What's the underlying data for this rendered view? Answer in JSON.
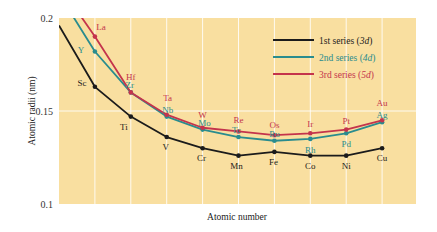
{
  "chart_data": {
    "type": "line",
    "title": "",
    "xlabel": "Atomic number",
    "ylabel": "Atomic radii (nm)",
    "ylim": [
      0.1,
      0.2
    ],
    "yticks": [
      0.1,
      0.15,
      0.2
    ],
    "ytick_labels": [
      "0.1",
      "0.15",
      "0.2"
    ],
    "grid": true,
    "legend_position": "top-right",
    "background_color": "#f9dfa0",
    "positions": 10,
    "series": [
      {
        "name": "1st series",
        "name_suffix": "3d",
        "color": "#1b1b1b",
        "label_color": "#1b1b1b",
        "leading_value": 0.196,
        "points": [
          {
            "label": "Sc",
            "value": 0.163
          },
          {
            "label": "Ti",
            "value": 0.147
          },
          {
            "label": "V",
            "value": 0.136
          },
          {
            "label": "Cr",
            "value": 0.13
          },
          {
            "label": "Mn",
            "value": 0.126
          },
          {
            "label": "Fe",
            "value": 0.128
          },
          {
            "label": "Co",
            "value": 0.126
          },
          {
            "label": "Ni",
            "value": 0.126
          },
          {
            "label": "Cu",
            "value": 0.13
          }
        ]
      },
      {
        "name": "2nd series",
        "name_suffix": "4d",
        "color": "#2a8c8e",
        "label_color": "#2a8c8e",
        "leading_value": 0.213,
        "points": [
          {
            "label": "Y",
            "value": 0.182
          },
          {
            "label": "Zr",
            "value": 0.16
          },
          {
            "label": "Nb",
            "value": 0.147
          },
          {
            "label": "Mo",
            "value": 0.14
          },
          {
            "label": "Tc",
            "value": 0.136
          },
          {
            "label": "Ru",
            "value": 0.134
          },
          {
            "label": "Rh",
            "value": 0.135
          },
          {
            "label": "Pd",
            "value": 0.138
          },
          {
            "label": "Ag",
            "value": 0.144
          }
        ]
      },
      {
        "name": "3rd series",
        "name_suffix": "5d",
        "color": "#c4344c",
        "label_color": "#c4344c",
        "leading_value": 0.218,
        "points": [
          {
            "label": "La",
            "value": 0.19
          },
          {
            "label": "Hf",
            "value": 0.16
          },
          {
            "label": "Ta",
            "value": 0.148
          },
          {
            "label": "W",
            "value": 0.141
          },
          {
            "label": "Re",
            "value": 0.139
          },
          {
            "label": "Os",
            "value": 0.137
          },
          {
            "label": "Ir",
            "value": 0.138
          },
          {
            "label": "Pt",
            "value": 0.14
          },
          {
            "label": "Au",
            "value": 0.145
          }
        ]
      }
    ]
  }
}
